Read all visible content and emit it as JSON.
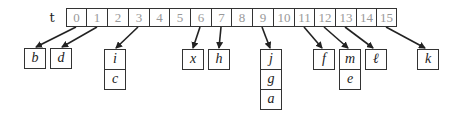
{
  "diagram": {
    "array_label": "t",
    "indices": [
      "0",
      "1",
      "2",
      "3",
      "4",
      "5",
      "6",
      "7",
      "8",
      "9",
      "10",
      "11",
      "12",
      "13",
      "14",
      "15"
    ],
    "chains": [
      {
        "index": 0,
        "items": [
          "b"
        ]
      },
      {
        "index": 1,
        "items": [
          "d"
        ]
      },
      {
        "index": 3,
        "items": [
          "i",
          "c"
        ]
      },
      {
        "index": 6,
        "items": [
          "x"
        ]
      },
      {
        "index": 7,
        "items": [
          "h"
        ]
      },
      {
        "index": 9,
        "items": [
          "j",
          "g",
          "a"
        ]
      },
      {
        "index": 11,
        "items": [
          "f"
        ]
      },
      {
        "index": 12,
        "items": [
          "m",
          "e"
        ]
      },
      {
        "index": 13,
        "items": [
          "ℓ"
        ]
      },
      {
        "index": 15,
        "items": [
          "k"
        ]
      }
    ]
  }
}
